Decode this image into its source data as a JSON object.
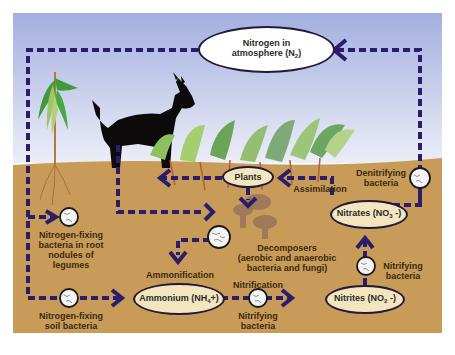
{
  "colors": {
    "sky_top": "#a3afe0",
    "sky_bottom": "#eceef7",
    "soil": "#c99b58",
    "arrow": "#2b1d6b",
    "node_fill": "#f3e6bf",
    "bacteria_fill": "#f4f4f4"
  },
  "nodes": {
    "atmosphere": {
      "line1": "Nitrogen in",
      "line2_pre": "atmosphere (N",
      "line2_sub": "2",
      "line2_post": ")"
    },
    "plants": {
      "label": "Plants"
    },
    "nitrates": {
      "pre": "Nitrates (NO",
      "sub": "3",
      "post": " -)"
    },
    "nitrites": {
      "pre": "Nitrites (NO",
      "sub": "2",
      "post": " -)"
    },
    "ammonium": {
      "pre": "Ammonium (NH",
      "sub": "4",
      "post": "+)"
    }
  },
  "labels": {
    "root_bacteria": [
      "Nitrogen-fixing",
      "bacteria in root",
      "nodules of",
      "legumes"
    ],
    "soil_bacteria": [
      "Nitrogen-fixing",
      "soil bacteria"
    ],
    "decomposers": [
      "Decomposers",
      "(aerobic and anaerobic",
      "bacteria and fungi)"
    ],
    "ammonification": "Ammonification",
    "nitrification": "Nitrification",
    "nitrifying_bottom": [
      "Nitrifying",
      "bacteria"
    ],
    "nitrifying_right": [
      "Nitrifying",
      "bacteria"
    ],
    "denitrifying": [
      "Denitrifying",
      "bacteria"
    ],
    "assimilation": "Assimilation"
  },
  "illustrations": [
    "corn-plant",
    "goat",
    "legume-plants",
    "mushrooms"
  ]
}
